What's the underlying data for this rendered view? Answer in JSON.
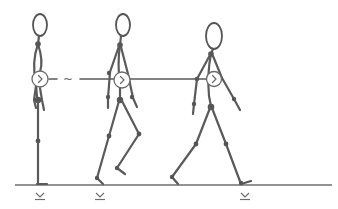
{
  "diagram": {
    "title": "Walking gait sequence",
    "figures": [
      {
        "id": "figure-1",
        "pose": "standing",
        "label": "Standing posture"
      },
      {
        "id": "figure-2",
        "pose": "mid-stride",
        "label": "Stride start"
      },
      {
        "id": "figure-3",
        "pose": "full-stride",
        "label": "Full stride"
      }
    ],
    "connector": {
      "symbol": "~",
      "style": "dashed-then-solid"
    },
    "ground_markers": [
      {
        "x": 40,
        "symbol": "⊻"
      },
      {
        "x": 100,
        "symbol": "⊻"
      },
      {
        "x": 245,
        "symbol": "⊻"
      }
    ],
    "pelvis_glyph": ">",
    "colors": {
      "stroke": "#5a5a5a",
      "background": "#ffffff"
    }
  }
}
